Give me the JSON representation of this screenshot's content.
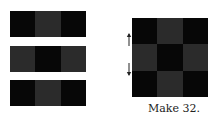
{
  "colors": {
    "black": "#070707",
    "grey": "#2b2b2b"
  },
  "strips": [
    {
      "top": 11,
      "cells": [
        "black",
        "grey",
        "black"
      ]
    },
    {
      "top": 46,
      "cells": [
        "grey",
        "black",
        "grey"
      ]
    },
    {
      "top": 80,
      "cells": [
        "black",
        "grey",
        "black"
      ]
    }
  ],
  "block": {
    "cells": [
      "black",
      "grey",
      "black",
      "grey",
      "black",
      "grey",
      "black",
      "grey",
      "black"
    ]
  },
  "arrows": [
    {
      "direction": "up",
      "top": 33
    },
    {
      "direction": "down",
      "top": 62
    }
  ],
  "caption": "Make 32."
}
